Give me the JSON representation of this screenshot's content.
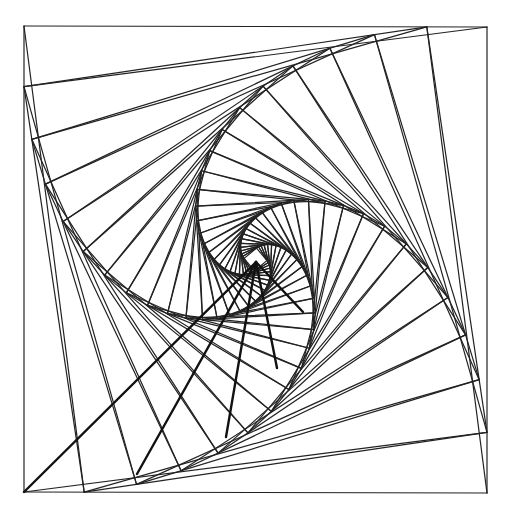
{
  "figure": {
    "type": "whirl-of-squares",
    "width": 510,
    "height": 517,
    "stroke_color": "#222222",
    "background": "#ffffff",
    "outer_square": [
      [
        24,
        26
      ],
      [
        487,
        27
      ],
      [
        487,
        493
      ],
      [
        24,
        492
      ]
    ],
    "whirl_ratio": 0.13,
    "levels": 26,
    "focus": [
      256,
      262
    ],
    "bold_rays_to": [
      [
        24,
        492
      ],
      [
        137,
        474
      ],
      [
        226,
        437
      ],
      [
        277,
        368
      ],
      [
        303,
        312
      ]
    ]
  }
}
